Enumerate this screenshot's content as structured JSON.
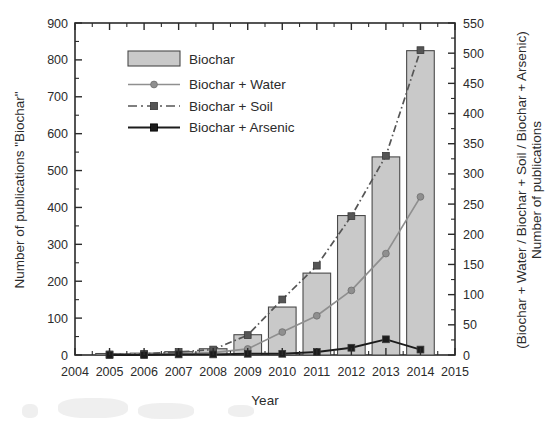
{
  "chart_data": {
    "type": "bar",
    "title": "",
    "xlabel": "Year",
    "ylabel": "Number of publications \"Biochar\"",
    "ylabel_right_line1": "Number of publications",
    "ylabel_right_line2": "(Biochar + Water / Biochar + Soil / Biochar + Arsenic)",
    "x": [
      2004,
      2005,
      2006,
      2007,
      2008,
      2009,
      2010,
      2011,
      2012,
      2013,
      2014,
      2015
    ],
    "xtick_labels": [
      "2004",
      "2005",
      "2006",
      "2007",
      "2008",
      "2009",
      "2010",
      "2011",
      "2012",
      "2013",
      "2014",
      "2015"
    ],
    "xlim": [
      2004,
      2015
    ],
    "ylim": [
      0,
      900
    ],
    "ytick_labels": [
      "0",
      "100",
      "200",
      "300",
      "400",
      "500",
      "600",
      "700",
      "800",
      "900"
    ],
    "ytick_values": [
      0,
      100,
      200,
      300,
      400,
      500,
      600,
      700,
      800,
      900
    ],
    "ylim_right": [
      0,
      550
    ],
    "ytick_labels_right": [
      "0",
      "50",
      "100",
      "150",
      "200",
      "250",
      "300",
      "350",
      "400",
      "450",
      "500",
      "550"
    ],
    "ytick_values_right": [
      0,
      50,
      100,
      150,
      200,
      250,
      300,
      350,
      400,
      450,
      500,
      550
    ],
    "grid": false,
    "legend_position": "upper left inside",
    "categories": [
      "2005",
      "2006",
      "2007",
      "2008",
      "2009",
      "2010",
      "2011",
      "2012",
      "2013",
      "2014"
    ],
    "values": [
      4,
      5,
      9,
      17,
      55,
      130,
      222,
      378,
      537,
      825
    ],
    "series": [
      {
        "name": "Biochar",
        "kind": "bar",
        "axis": "left",
        "x": [
          2005,
          2006,
          2007,
          2008,
          2009,
          2010,
          2011,
          2012,
          2013,
          2014
        ],
        "values": [
          4,
          5,
          9,
          17,
          55,
          130,
          222,
          378,
          537,
          825
        ],
        "fill_color": "#c9c9c9",
        "edge_color": "#4a4a4a"
      },
      {
        "name": "Biochar + Water",
        "kind": "line",
        "axis": "right",
        "marker": "circle",
        "linestyle": "solid",
        "x": [
          2005,
          2006,
          2007,
          2008,
          2009,
          2010,
          2011,
          2012,
          2013,
          2014
        ],
        "values": [
          1,
          1,
          2,
          4,
          10,
          38,
          65,
          107,
          168,
          262
        ],
        "color": "#8f8f8f"
      },
      {
        "name": "Biochar + Soil",
        "kind": "line",
        "axis": "right",
        "marker": "square",
        "linestyle": "dashdot",
        "x": [
          2005,
          2006,
          2007,
          2008,
          2009,
          2010,
          2011,
          2012,
          2013,
          2014
        ],
        "values": [
          1,
          2,
          5,
          9,
          33,
          92,
          148,
          230,
          330,
          505
        ],
        "color": "#555555"
      },
      {
        "name": "Biochar + Arsenic",
        "kind": "line",
        "axis": "right",
        "marker": "square",
        "linestyle": "solid",
        "x": [
          2005,
          2006,
          2007,
          2008,
          2009,
          2010,
          2011,
          2012,
          2013,
          2014
        ],
        "values": [
          0,
          0,
          1,
          1,
          2,
          2,
          5,
          12,
          26,
          9
        ],
        "color": "#1c1c1c"
      }
    ],
    "legend": [
      {
        "label": "Biochar",
        "style": "patch"
      },
      {
        "label": "Biochar + Water",
        "style": "line-circle"
      },
      {
        "label": "Biochar + Soil",
        "style": "dashdot-square"
      },
      {
        "label": "Biochar + Arsenic",
        "style": "line-square"
      }
    ]
  },
  "colors": {
    "bar_fill": "#c9c9c9",
    "bar_edge": "#4a4a4a",
    "water": "#8f8f8f",
    "soil": "#555555",
    "arsenic": "#1c1c1c",
    "axis": "#2b2b2b",
    "background": "#ffffff"
  }
}
